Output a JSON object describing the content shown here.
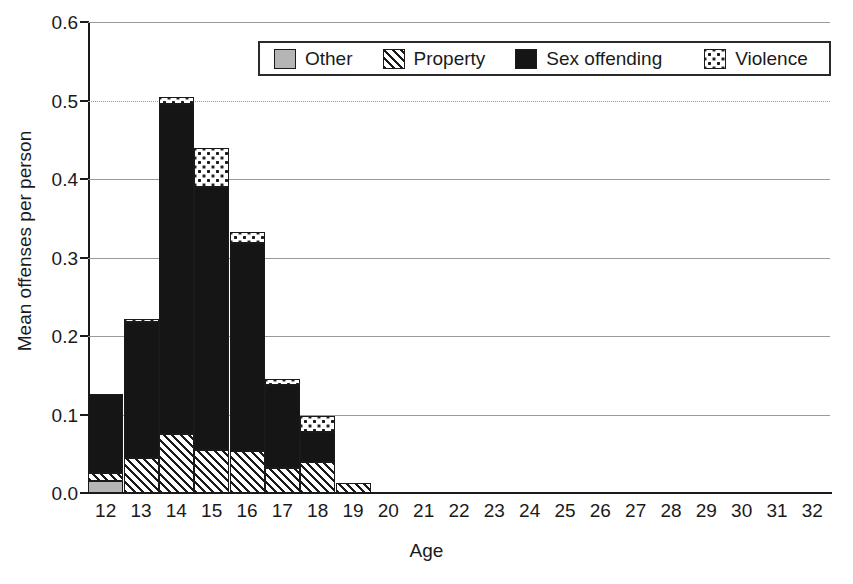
{
  "chart_data": {
    "type": "bar",
    "subtype": "stacked-bar",
    "title": "",
    "xlabel": "Age",
    "ylabel": "Mean offenses per person",
    "categories": [
      "12",
      "13",
      "14",
      "15",
      "16",
      "17",
      "18",
      "19",
      "20",
      "21",
      "22",
      "23",
      "24",
      "25",
      "26",
      "27",
      "28",
      "29",
      "30",
      "31",
      "32"
    ],
    "series": [
      {
        "name": "Other",
        "pattern": "solid-gray",
        "color": "#b5b5b5",
        "values": [
          0.015,
          0.0,
          0.0,
          0.0,
          0.0,
          0.0,
          0.0,
          0.0,
          0,
          0,
          0,
          0,
          0,
          0,
          0,
          0,
          0,
          0,
          0,
          0,
          0
        ]
      },
      {
        "name": "Property",
        "pattern": "diagonal-hatch",
        "color": "#ffffff",
        "values": [
          0.01,
          0.045,
          0.075,
          0.055,
          0.053,
          0.032,
          0.04,
          0.013,
          0,
          0,
          0,
          0,
          0,
          0,
          0,
          0,
          0,
          0,
          0,
          0,
          0
        ]
      },
      {
        "name": "Sex offending",
        "pattern": "solid-black",
        "color": "#151515",
        "values": [
          0.101,
          0.173,
          0.42,
          0.335,
          0.265,
          0.106,
          0.038,
          0.0,
          0,
          0,
          0,
          0,
          0,
          0,
          0,
          0,
          0,
          0,
          0,
          0,
          0
        ]
      },
      {
        "name": "Violence",
        "pattern": "dotted",
        "color": "#ffffff",
        "values": [
          0.0,
          0.004,
          0.01,
          0.05,
          0.015,
          0.007,
          0.02,
          0.0,
          0,
          0,
          0,
          0,
          0,
          0,
          0,
          0,
          0,
          0,
          0,
          0,
          0
        ]
      }
    ],
    "totals": [
      0.126,
      0.222,
      0.505,
      0.44,
      0.333,
      0.145,
      0.098,
      0.013,
      0,
      0,
      0,
      0,
      0,
      0,
      0,
      0,
      0,
      0,
      0,
      0,
      0
    ],
    "ylim": [
      0.0,
      0.6
    ],
    "yticks": [
      "0.0",
      "0.1",
      "0.2",
      "0.3",
      "0.4",
      "0.5",
      "0.6"
    ],
    "ytick_values": [
      0.0,
      0.1,
      0.2,
      0.3,
      0.4,
      0.5,
      0.6
    ],
    "grid": true,
    "grid_axis": "y",
    "legend_position": "top-center-inside",
    "legend": [
      "Other",
      "Property",
      "Sex offending",
      "Violence"
    ]
  },
  "axes": {
    "y_label": "Mean offenses per person",
    "x_label": "Age"
  }
}
